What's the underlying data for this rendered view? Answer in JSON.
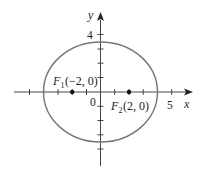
{
  "diagram": {
    "type": "ellipse-with-foci",
    "equation_implied": "x^2/16 + y^2/12 = 1",
    "axes": {
      "x_label": "x",
      "y_label": "y",
      "origin_label": "0",
      "x_tick_label": "5",
      "y_tick_label": "4"
    },
    "foci": [
      {
        "name": "F",
        "subscript": "1",
        "coords": "(−2, 0)",
        "x": -2,
        "y": 0
      },
      {
        "name": "F",
        "subscript": "2",
        "coords": "(2, 0)",
        "x": 2,
        "y": 0
      }
    ],
    "ellipse": {
      "a": 4,
      "b": 3.46,
      "center": [
        0,
        0
      ],
      "stroke": "#777777"
    },
    "colors": {
      "axis": "#222222",
      "ellipse": "#777777",
      "point": "#111111"
    }
  }
}
